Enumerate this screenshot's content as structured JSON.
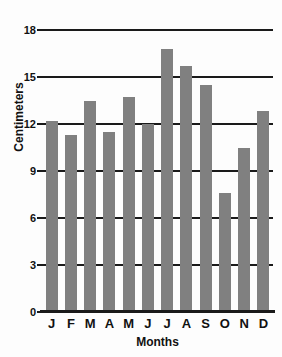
{
  "chart_data": {
    "type": "bar",
    "title": "",
    "xlabel": "Months",
    "ylabel": "Centimeters",
    "categories": [
      "J",
      "F",
      "M",
      "A",
      "M",
      "J",
      "J",
      "A",
      "S",
      "O",
      "N",
      "D"
    ],
    "values": [
      12.2,
      11.3,
      13.5,
      11.5,
      13.7,
      12.0,
      16.8,
      15.7,
      14.5,
      7.6,
      10.5,
      12.8
    ],
    "ylim": [
      0,
      18
    ],
    "yticks": [
      0,
      3,
      6,
      9,
      12,
      15,
      18
    ],
    "ytick_labels": [
      "0",
      "3",
      "6",
      "9",
      "12",
      "15",
      "18"
    ],
    "grid": true,
    "legend": null,
    "bar_color": "#808080",
    "axis_color": "#1a1a1a",
    "background_color": "#fdfdfd"
  }
}
